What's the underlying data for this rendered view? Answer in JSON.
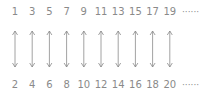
{
  "diagram": {
    "top_row": [
      "1",
      "3",
      "5",
      "7",
      "9",
      "11",
      "13",
      "15",
      "17",
      "19"
    ],
    "bottom_row": [
      "2",
      "4",
      "6",
      "8",
      "10",
      "12",
      "14",
      "16",
      "18",
      "20"
    ],
    "ellipsis": "······",
    "connector": "double-headed-arrow",
    "color": "#8a8a8a"
  }
}
